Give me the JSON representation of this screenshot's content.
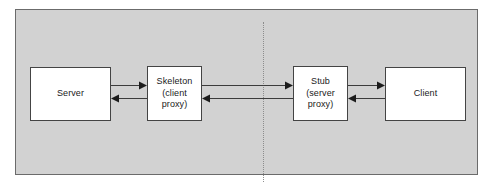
{
  "diagram": {
    "type": "rpc-proxy-architecture",
    "panel": {
      "background_color": "#d2d2d2",
      "border_color": "#6b6b6b"
    },
    "network_boundary": {
      "name": "network-boundary",
      "style": "dotted",
      "color": "#8d8d8d",
      "orientation": "vertical"
    },
    "nodes": [
      {
        "id": "server",
        "label": "Server",
        "fill": "#ffffff",
        "border_color": "#444444"
      },
      {
        "id": "skeleton",
        "label": "Skeleton\n(client\nproxy)",
        "fill": "#ffffff",
        "border_color": "#444444"
      },
      {
        "id": "stub",
        "label": "Stub\n(server\nproxy)",
        "fill": "#ffffff",
        "border_color": "#444444"
      },
      {
        "id": "client",
        "label": "Client",
        "fill": "#ffffff",
        "border_color": "#444444"
      }
    ],
    "connections": [
      {
        "id": "server-to-skeleton",
        "from": "server",
        "to": "skeleton",
        "direction": "right",
        "row": "top"
      },
      {
        "id": "skeleton-to-server",
        "from": "skeleton",
        "to": "server",
        "direction": "left",
        "row": "bottom"
      },
      {
        "id": "skeleton-to-stub",
        "from": "skeleton",
        "to": "stub",
        "direction": "right",
        "row": "top"
      },
      {
        "id": "stub-to-skeleton",
        "from": "stub",
        "to": "skeleton",
        "direction": "left",
        "row": "bottom"
      },
      {
        "id": "stub-to-client",
        "from": "stub",
        "to": "client",
        "direction": "right",
        "row": "top"
      },
      {
        "id": "client-to-stub",
        "from": "client",
        "to": "stub",
        "direction": "left",
        "row": "bottom"
      }
    ]
  }
}
